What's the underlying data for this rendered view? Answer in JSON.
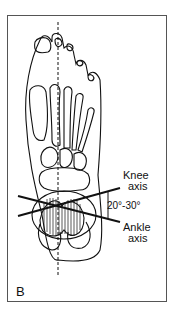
{
  "figure": {
    "panel_label": "B",
    "labels": {
      "knee_axis_line1": "Knee",
      "knee_axis_line2": "axis",
      "angle": "20°-30°",
      "ankle_axis_line1": "Ankle",
      "ankle_axis_line2": "axis"
    },
    "colors": {
      "line": "#111111",
      "frame": "#555555",
      "background": "#ffffff"
    }
  }
}
